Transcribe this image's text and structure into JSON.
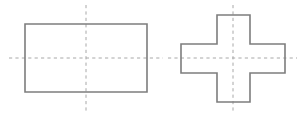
{
  "figure": {
    "background_color": "#ffffff",
    "canvas": {
      "width": 301,
      "height": 115
    },
    "style": {
      "outline_color": "#7d7d7d",
      "outline_width": 1.6,
      "centerline_color": "#a8a8a8",
      "centerline_width": 1,
      "centerline_dash": "3.2 3.2"
    },
    "shapes": [
      {
        "id": "rectangle",
        "name": "rectangle-outline",
        "kind": "rectangle",
        "label": "Rectangle",
        "x": 25,
        "y": 24,
        "width": 122,
        "height": 68,
        "points": "25,24 147,24 147,92 25,92 25,24",
        "centerlines": {
          "vertical": {
            "x": 86,
            "y1": 5,
            "y2": 111
          },
          "horizontal": {
            "y": 58,
            "x1": 9,
            "x2": 163
          }
        }
      },
      {
        "id": "cross",
        "name": "cross-outline",
        "kind": "cross",
        "label": "Cross / plus",
        "left": 181,
        "right": 285,
        "top": 15,
        "bottom": 102,
        "arm_left": 217,
        "arm_right": 250,
        "arm_top": 44,
        "arm_bottom": 73,
        "points": "217,15 250,15 250,44 285,44 285,73 250,73 250,102 217,102 217,73 181,73 181,44 217,44 217,15",
        "centerlines": {
          "vertical": {
            "x": 233,
            "y1": 5,
            "y2": 112
          },
          "horizontal": {
            "y": 58,
            "x1": 168,
            "x2": 297
          }
        }
      }
    ]
  }
}
